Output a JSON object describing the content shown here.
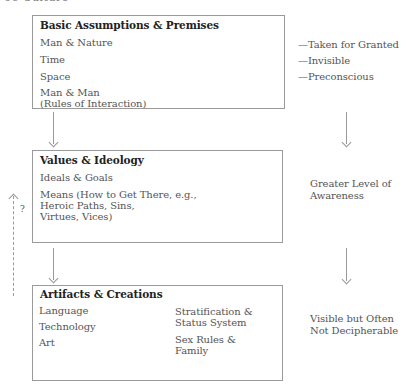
{
  "header": {
    "partial_text": "66    Culture"
  },
  "levels": [
    {
      "title": "Basic Assumptions & Premises",
      "items": [
        "Man & Nature",
        "Time",
        "Space",
        "Man & Man",
        "(Rules of Interaction)"
      ],
      "side_labels": [
        "—Taken for Granted",
        "—Invisible",
        "—Preconscious"
      ]
    },
    {
      "title": "Values & Ideology",
      "items": [
        "Ideals & Goals",
        "Means (How to Get There, e.g.,",
        "Heroic Paths, Sins,",
        "Virtues, Vices)"
      ],
      "side_labels": [
        "Greater Level of",
        "Awareness"
      ]
    },
    {
      "title": "Artifacts & Creations",
      "items_left": [
        "Language",
        "Technology",
        "Art"
      ],
      "items_right": [
        "Stratification &",
        "Status System",
        "Sex Rules &",
        "Family"
      ],
      "side_labels": [
        "Visible but Often",
        "Not Decipherable"
      ]
    }
  ],
  "feedback": {
    "label": "?"
  },
  "colors": {
    "border": "#9a9a9a",
    "text": "#555555",
    "title": "#222222",
    "arrow": "#999999"
  }
}
